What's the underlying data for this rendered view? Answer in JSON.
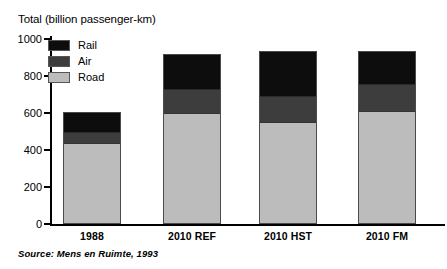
{
  "chart_data": {
    "type": "bar",
    "subtype": "stacked-vertical",
    "title": "Total (billion passenger-km)",
    "xlabel": "",
    "ylabel": "Total (billion passenger-km)",
    "ylim": [
      0,
      1000
    ],
    "yticks": [
      0,
      200,
      400,
      600,
      800,
      1000
    ],
    "ytick_labels": [
      "0",
      "200",
      "400",
      "600",
      "800",
      "1000"
    ],
    "grid": false,
    "legend_position": "top-left inside",
    "categories": [
      "1988",
      "2010 REF",
      "2010 HST",
      "2010 FM"
    ],
    "series": [
      {
        "name": "Road",
        "color": "#bcbcbc",
        "values": [
          440,
          600,
          550,
          610
        ]
      },
      {
        "name": "Air",
        "color": "#3d3d3d",
        "values": [
          60,
          135,
          145,
          150
        ]
      },
      {
        "name": "Rail",
        "color": "#0d0d0d",
        "values": [
          105,
          185,
          240,
          175
        ]
      }
    ],
    "totals": [
      605,
      920,
      935,
      935
    ],
    "source": "Source: Mens en Ruimte, 1993"
  },
  "legend": {
    "items": [
      {
        "label": "Rail",
        "color": "#0d0d0d"
      },
      {
        "label": "Air",
        "color": "#3d3d3d"
      },
      {
        "label": "Road",
        "color": "#bcbcbc"
      }
    ]
  }
}
